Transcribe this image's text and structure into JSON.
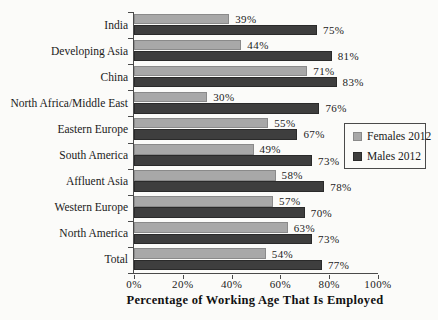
{
  "chart_data": {
    "type": "bar",
    "orientation": "horizontal",
    "title": "",
    "xlabel": "Percentage of Working Age That Is Employed",
    "categories": [
      "India",
      "Developing Asia",
      "China",
      "North Africa/Middle East",
      "Eastern Europe",
      "South America",
      "Affluent Asia",
      "Western Europe",
      "North America",
      "Total"
    ],
    "series": [
      {
        "name": "Females 2012",
        "color": "#a8a8a8",
        "values": [
          39,
          44,
          71,
          30,
          55,
          49,
          58,
          57,
          63,
          54
        ]
      },
      {
        "name": "Males 2012",
        "color": "#3e3e3e",
        "values": [
          75,
          81,
          83,
          76,
          67,
          73,
          78,
          70,
          73,
          77
        ]
      }
    ],
    "value_label_suffix": "%",
    "x_ticks": [
      "0%",
      "20%",
      "40%",
      "60%",
      "80%",
      "100%"
    ],
    "xlim": [
      0,
      100
    ],
    "grid": false,
    "legend_position": "middle-right"
  },
  "colors": {
    "background": "#fbfbf9",
    "axis": "#4a4a4a",
    "text": "#1e1e1e"
  }
}
